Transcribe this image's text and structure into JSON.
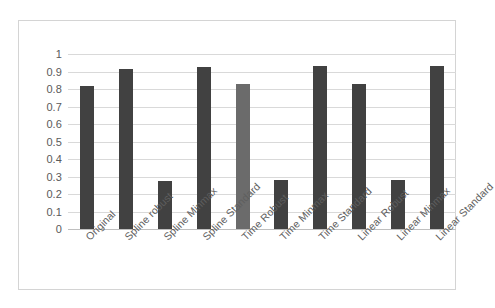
{
  "chart_data": {
    "type": "bar",
    "title": "",
    "subtitle": "",
    "xlabel": "",
    "ylabel": "",
    "ylim": [
      0,
      1
    ],
    "grid": true,
    "legend": "none",
    "y_ticks": [
      "1",
      "0.9",
      "0.8",
      "0.7",
      "0.6",
      "0.5",
      "0.4",
      "0.3",
      "0.2",
      "0.1",
      "0"
    ],
    "y_tick_values": [
      1,
      0.9,
      0.8,
      0.7,
      0.6,
      0.5,
      0.4,
      0.3,
      0.2,
      0.1,
      0
    ],
    "categories": [
      "Original",
      "Spline robust",
      "Spline Minmax",
      "Spline Standard",
      "Time Robust",
      "Time Minmax",
      "Time Standard",
      "Linear Robust",
      "Linear Minmax",
      "Linear Standard"
    ],
    "values": [
      0.82,
      0.915,
      0.275,
      0.925,
      0.83,
      0.28,
      0.93,
      0.83,
      0.28,
      0.93
    ],
    "bar_colors": [
      "#414141",
      "#414141",
      "#414141",
      "#414141",
      "#6b6b6b",
      "#414141",
      "#414141",
      "#414141",
      "#414141",
      "#414141"
    ]
  },
  "style": {
    "bar_color": "#414141",
    "bar_color_highlight": "#6b6b6b",
    "gridline_color": "#d9d9d9",
    "axis_color": "#bfbfbf",
    "frame_color": "#d4d4d4",
    "tick_label_color": "#5a5a5a",
    "background": "#ffffff"
  }
}
